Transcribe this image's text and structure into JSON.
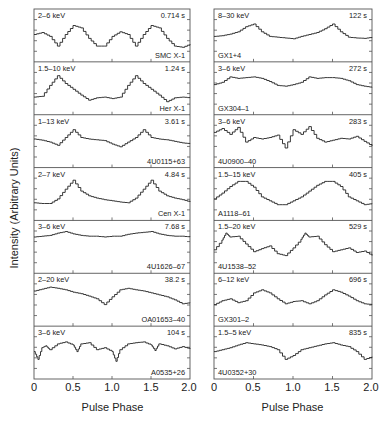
{
  "chart_data": {
    "type": "line",
    "title": "",
    "xlabel": "Pulse Phase",
    "ylabel": "Intensity (Arbitrary Units)",
    "xlim": [
      0,
      2.0
    ],
    "x_ticks": [
      "0",
      "0.5",
      "1.0",
      "1.5",
      "2.0"
    ],
    "layout": {
      "columns": 2,
      "rows": 7,
      "grid": false,
      "legend": "none"
    },
    "panels": [
      {
        "column": "left",
        "row": 1,
        "source": "SMC X-1",
        "energy": "2–6 keV",
        "period": "0.714 s",
        "x": [
          0,
          0.1,
          0.2,
          0.3,
          0.4,
          0.5,
          0.6,
          0.7,
          0.8,
          0.9,
          1.0,
          1.1,
          1.2,
          1.3,
          1.4,
          1.5,
          1.6,
          1.7,
          1.8,
          1.9,
          2.0
        ],
        "y": [
          0.55,
          0.6,
          0.5,
          0.25,
          0.55,
          0.78,
          0.72,
          0.45,
          0.25,
          0.25,
          0.5,
          0.62,
          0.55,
          0.25,
          0.55,
          0.78,
          0.72,
          0.45,
          0.25,
          0.22,
          0.3
        ]
      },
      {
        "column": "left",
        "row": 2,
        "source": "Her X-1",
        "energy": "1.5–10 keV",
        "period": "1.24 s",
        "x": [
          0,
          0.1,
          0.2,
          0.3,
          0.4,
          0.5,
          0.6,
          0.7,
          0.8,
          0.9,
          1.0,
          1.1,
          1.2,
          1.3,
          1.4,
          1.5,
          1.6,
          1.7,
          1.8,
          1.9,
          2.0
        ],
        "y": [
          0.3,
          0.32,
          0.6,
          0.85,
          0.65,
          0.5,
          0.35,
          0.22,
          0.28,
          0.3,
          0.26,
          0.3,
          0.6,
          0.85,
          0.65,
          0.5,
          0.35,
          0.18,
          0.28,
          0.3,
          0.28
        ]
      },
      {
        "column": "left",
        "row": 3,
        "source": "4U0115+63",
        "energy": "1–13 keV",
        "period": "3.61 s",
        "x": [
          0,
          0.1,
          0.2,
          0.3,
          0.4,
          0.5,
          0.6,
          0.7,
          0.8,
          0.9,
          1.0,
          1.1,
          1.2,
          1.3,
          1.4,
          1.5,
          1.6,
          1.7,
          1.8,
          1.9,
          2.0
        ],
        "y": [
          0.58,
          0.55,
          0.5,
          0.42,
          0.62,
          0.82,
          0.62,
          0.58,
          0.56,
          0.54,
          0.45,
          0.38,
          0.5,
          0.62,
          0.82,
          0.62,
          0.58,
          0.56,
          0.52,
          0.48,
          0.46
        ]
      },
      {
        "column": "left",
        "row": 4,
        "source": "Cen X-1",
        "energy": "2–7 keV",
        "period": "4.84 s",
        "x": [
          0,
          0.1,
          0.2,
          0.3,
          0.4,
          0.5,
          0.6,
          0.7,
          0.8,
          0.9,
          1.0,
          1.1,
          1.2,
          1.3,
          1.4,
          1.5,
          1.6,
          1.7,
          1.8,
          1.9,
          2.0
        ],
        "y": [
          0.3,
          0.28,
          0.28,
          0.4,
          0.65,
          0.88,
          0.6,
          0.48,
          0.42,
          0.38,
          0.35,
          0.32,
          0.3,
          0.42,
          0.65,
          0.88,
          0.6,
          0.48,
          0.42,
          0.38,
          0.32
        ]
      },
      {
        "column": "left",
        "row": 5,
        "source": "4U1626–67",
        "energy": "3–6 keV",
        "period": "7.68 s",
        "x": [
          0,
          0.1,
          0.2,
          0.3,
          0.4,
          0.5,
          0.6,
          0.7,
          0.8,
          0.9,
          1.0,
          1.1,
          1.2,
          1.3,
          1.4,
          1.5,
          1.6,
          1.7,
          1.8,
          1.9,
          2.0
        ],
        "y": [
          0.78,
          0.8,
          0.82,
          0.88,
          0.92,
          0.86,
          0.82,
          0.8,
          0.8,
          0.78,
          0.8,
          0.8,
          0.85,
          0.88,
          0.9,
          0.92,
          0.86,
          0.82,
          0.8,
          0.8,
          0.78
        ]
      },
      {
        "column": "left",
        "row": 6,
        "source": "OA01653–40",
        "energy": "2–20 keV",
        "period": "38.2 s",
        "x": [
          0,
          0.1,
          0.2,
          0.3,
          0.4,
          0.5,
          0.6,
          0.7,
          0.8,
          0.9,
          1.0,
          1.1,
          1.2,
          1.3,
          1.4,
          1.5,
          1.6,
          1.7,
          1.8,
          1.9,
          2.0
        ],
        "y": [
          0.75,
          0.8,
          0.85,
          0.82,
          0.78,
          0.72,
          0.68,
          0.62,
          0.55,
          0.4,
          0.6,
          0.78,
          0.82,
          0.78,
          0.75,
          0.7,
          0.65,
          0.6,
          0.52,
          0.42,
          0.45
        ]
      },
      {
        "column": "left",
        "row": 7,
        "source": "A0535+26",
        "energy": "3–6 keV",
        "period": "104 s",
        "x": [
          0,
          0.05,
          0.1,
          0.15,
          0.2,
          0.3,
          0.4,
          0.5,
          0.55,
          0.6,
          0.7,
          0.8,
          0.9,
          1.0,
          1.05,
          1.1,
          1.2,
          1.3,
          1.4,
          1.5,
          1.55,
          1.6,
          1.7,
          1.8,
          1.9,
          2.0
        ],
        "y": [
          0.55,
          0.35,
          0.65,
          0.7,
          0.6,
          0.75,
          0.8,
          0.72,
          0.55,
          0.75,
          0.78,
          0.6,
          0.65,
          0.55,
          0.3,
          0.6,
          0.75,
          0.78,
          0.8,
          0.72,
          0.58,
          0.75,
          0.7,
          0.62,
          0.68,
          0.62
        ]
      },
      {
        "column": "right",
        "row": 1,
        "source": "GX1+4",
        "energy": "8–30 keV",
        "period": "122 s",
        "x": [
          0,
          0.1,
          0.2,
          0.3,
          0.4,
          0.5,
          0.6,
          0.7,
          0.8,
          0.9,
          1.0,
          1.1,
          1.2,
          1.3,
          1.4,
          1.5,
          1.6,
          1.7,
          1.8,
          1.9,
          2.0
        ],
        "y": [
          0.5,
          0.52,
          0.56,
          0.62,
          0.75,
          0.82,
          0.62,
          0.5,
          0.48,
          0.46,
          0.44,
          0.5,
          0.55,
          0.6,
          0.7,
          0.82,
          0.62,
          0.48,
          0.46,
          0.45,
          0.48
        ]
      },
      {
        "column": "right",
        "row": 2,
        "source": "GX304–1",
        "energy": "3–6 keV",
        "period": "272 s",
        "x": [
          0,
          0.1,
          0.2,
          0.3,
          0.4,
          0.5,
          0.6,
          0.7,
          0.8,
          0.9,
          1.0,
          1.1,
          1.2,
          1.3,
          1.4,
          1.5,
          1.6,
          1.7,
          1.8,
          1.9,
          2.0
        ],
        "y": [
          0.62,
          0.68,
          0.82,
          0.78,
          0.8,
          0.82,
          0.78,
          0.7,
          0.6,
          0.58,
          0.62,
          0.68,
          0.82,
          0.78,
          0.8,
          0.8,
          0.78,
          0.72,
          0.62,
          0.58,
          0.55
        ]
      },
      {
        "column": "right",
        "row": 3,
        "source": "4U0900–40",
        "energy": "3–6 keV",
        "period": "283 s",
        "x": [
          0,
          0.1,
          0.2,
          0.3,
          0.4,
          0.5,
          0.6,
          0.7,
          0.8,
          0.9,
          1.0,
          1.1,
          1.2,
          1.3,
          1.4,
          1.5,
          1.6,
          1.7,
          1.8,
          1.9,
          2.0
        ],
        "y": [
          0.75,
          0.85,
          0.7,
          0.88,
          0.5,
          0.62,
          0.58,
          0.62,
          0.68,
          0.35,
          0.82,
          0.7,
          0.9,
          0.6,
          0.5,
          0.55,
          0.6,
          0.58,
          0.65,
          0.52,
          0.4
        ]
      },
      {
        "column": "right",
        "row": 4,
        "source": "A1118–61",
        "energy": "1.5–15 keV",
        "period": "405 s",
        "x": [
          0,
          0.1,
          0.2,
          0.3,
          0.4,
          0.5,
          0.6,
          0.7,
          0.8,
          0.9,
          1.0,
          1.1,
          1.2,
          1.3,
          1.4,
          1.5,
          1.6,
          1.7,
          1.8,
          1.9,
          2.0
        ],
        "y": [
          0.4,
          0.55,
          0.72,
          0.85,
          0.85,
          0.7,
          0.45,
          0.35,
          0.25,
          0.25,
          0.35,
          0.45,
          0.6,
          0.75,
          0.85,
          0.85,
          0.72,
          0.45,
          0.35,
          0.25,
          0.28
        ]
      },
      {
        "column": "right",
        "row": 5,
        "source": "4U1538–52",
        "energy": "1.5–20 keV",
        "period": "529 s",
        "x": [
          0,
          0.1,
          0.15,
          0.2,
          0.3,
          0.4,
          0.5,
          0.6,
          0.7,
          0.8,
          0.9,
          1.0,
          1.1,
          1.15,
          1.2,
          1.3,
          1.4,
          1.5,
          1.6,
          1.7,
          1.8,
          1.9,
          2.0
        ],
        "y": [
          0.45,
          0.7,
          0.88,
          0.78,
          0.8,
          0.6,
          0.4,
          0.48,
          0.55,
          0.35,
          0.3,
          0.5,
          0.72,
          0.88,
          0.78,
          0.8,
          0.58,
          0.4,
          0.45,
          0.5,
          0.38,
          0.42,
          0.3
        ]
      },
      {
        "column": "right",
        "row": 6,
        "source": "GX301–2",
        "energy": "6–12 keV",
        "period": "696 s",
        "x": [
          0,
          0.1,
          0.2,
          0.3,
          0.4,
          0.5,
          0.6,
          0.7,
          0.8,
          0.9,
          1.0,
          1.1,
          1.2,
          1.3,
          1.4,
          1.5,
          1.6,
          1.7,
          1.8,
          1.9,
          2.0
        ],
        "y": [
          0.4,
          0.5,
          0.55,
          0.45,
          0.5,
          0.7,
          0.78,
          0.7,
          0.55,
          0.42,
          0.48,
          0.5,
          0.42,
          0.5,
          0.65,
          0.78,
          0.72,
          0.62,
          0.5,
          0.42,
          0.4
        ]
      },
      {
        "column": "right",
        "row": 7,
        "source": "4U0352+30",
        "energy": "1.5–5 keV",
        "period": "835 s",
        "x": [
          0,
          0.1,
          0.2,
          0.3,
          0.4,
          0.5,
          0.6,
          0.7,
          0.8,
          0.9,
          1.0,
          1.1,
          1.2,
          1.3,
          1.4,
          1.5,
          1.6,
          1.7,
          1.8,
          1.9,
          2.0
        ],
        "y": [
          0.55,
          0.6,
          0.65,
          0.72,
          0.78,
          0.75,
          0.72,
          0.68,
          0.6,
          0.35,
          0.45,
          0.6,
          0.65,
          0.7,
          0.75,
          0.78,
          0.72,
          0.68,
          0.55,
          0.35,
          0.42
        ]
      }
    ]
  }
}
